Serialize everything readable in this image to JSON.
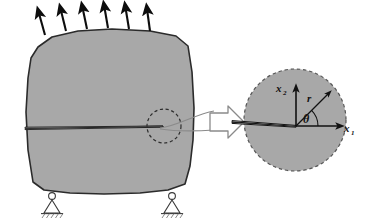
{
  "figure": {
    "type": "fracture-mechanics-schematic",
    "background_color": "#ffffff"
  },
  "colors": {
    "body_fill": "#a8a8a8",
    "body_outline": "#2b2b2b",
    "inset_fill": "#a8a8a8",
    "inset_dash_outline": "#555555",
    "crack_fill": "#ffffff",
    "crack_outline": "#1a1a1a",
    "load_arrow": "#0d0d0d",
    "callout_arrow_fill": "#ffffff",
    "callout_arrow_outline": "#8a8a8a",
    "support_outline": "#3a3a3a",
    "label_color": "#111111"
  },
  "body_panel": {
    "name": "cracked-body",
    "outline_points": "38,47 52,37 78,31 112,29 150,31 176,36 188,46 192,72 194,108 193,140 190,166 185,184 168,190 140,193 104,194 70,193 44,190 33,182 28,150 26,112 28,78 31,58",
    "crack": {
      "name": "macro-crack",
      "tip_x": 163,
      "tip_y": 126,
      "tail_x": 25,
      "tail_y": 128
    }
  },
  "load_arrows": {
    "name": "applied-load-arrows",
    "count": 6,
    "direction": "upward",
    "tilt_degrees": 12,
    "arrows": [
      {
        "x1": 45,
        "y1": 35,
        "x2": 38,
        "y2": 11
      },
      {
        "x1": 66,
        "y1": 31,
        "x2": 60,
        "y2": 8
      },
      {
        "x1": 87,
        "y1": 29,
        "x2": 82,
        "y2": 6
      },
      {
        "x1": 108,
        "y1": 28,
        "x2": 104,
        "y2": 5
      },
      {
        "x1": 129,
        "y1": 29,
        "x2": 125,
        "y2": 6
      },
      {
        "x1": 150,
        "y1": 31,
        "x2": 147,
        "y2": 8
      }
    ]
  },
  "tip_marker": {
    "name": "crack-tip-dashed-circle",
    "cx": 164,
    "cy": 126,
    "r": 17
  },
  "callout": {
    "name": "magnification-callout-arrow",
    "label": "",
    "from_x": 178,
    "to_x": 240
  },
  "supports": {
    "name": "roller-supports",
    "count": 2,
    "items": [
      {
        "name": "support-left",
        "x": 52,
        "y": 190
      },
      {
        "name": "support-right",
        "x": 172,
        "y": 190
      }
    ]
  },
  "inset": {
    "name": "crack-tip-inset",
    "circle": {
      "cx": 295,
      "cy": 120,
      "r": 51,
      "stroke_style": "dashed"
    },
    "origin": {
      "x": 296,
      "y": 126
    },
    "crack": {
      "tip_x": 296,
      "tip_y": 126,
      "tail_x": 232,
      "tail_y": 122
    },
    "axes": {
      "x1": {
        "label": "x",
        "subscript": "1",
        "end_x": 345,
        "end_y": 126
      },
      "x2": {
        "label": "x",
        "subscript": "2",
        "end_x": 296,
        "end_y": 85
      }
    },
    "radial": {
      "label": "r",
      "angle_degrees": 45,
      "length": 46
    },
    "angle": {
      "label": "θ",
      "arc_radius": 22
    }
  },
  "labels": {
    "x1_base": "x",
    "x1_sub": "1",
    "x2_base": "x",
    "x2_sub": "2",
    "r": "r",
    "theta": "θ"
  }
}
